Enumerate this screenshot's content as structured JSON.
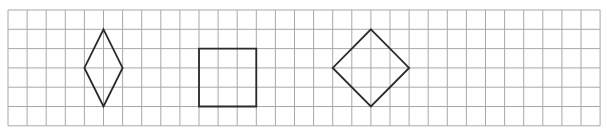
{
  "figure": {
    "background": "#ffffff",
    "grid": {
      "origin_x": 8,
      "origin_y": 10,
      "cols": 31,
      "rows": 6,
      "cell_w": 19.1,
      "cell_h": 19.3,
      "line_color": "#a8a8a8"
    },
    "shape_color": "#2a2a2a",
    "shapes": [
      {
        "name": "rhombus",
        "description": "Tall rhombus, 2 cells wide and 4 cells tall",
        "points_grid": [
          [
            5,
            1
          ],
          [
            6,
            3
          ],
          [
            5,
            5
          ],
          [
            4,
            3
          ]
        ]
      },
      {
        "name": "square",
        "description": "Axis-aligned square, 3 by 3 cells",
        "points_grid": [
          [
            10,
            2
          ],
          [
            13,
            2
          ],
          [
            13,
            5
          ],
          [
            10,
            5
          ]
        ]
      },
      {
        "name": "rotated-square",
        "description": "Square rotated 45 degrees, diagonals 4 cells",
        "points_grid": [
          [
            19,
            1
          ],
          [
            21,
            3
          ],
          [
            19,
            5
          ],
          [
            17,
            3
          ]
        ]
      }
    ]
  }
}
